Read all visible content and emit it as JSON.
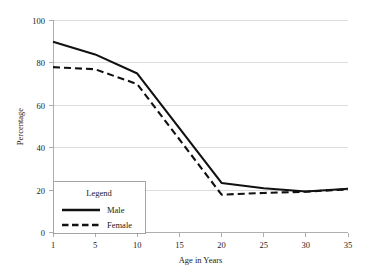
{
  "chart_data": {
    "type": "line",
    "title": "",
    "subtitle": "",
    "xlabel": "Age in Years",
    "ylabel": "Percentage",
    "x": [
      1,
      5,
      10,
      20,
      25,
      30,
      35
    ],
    "xticks": [
      "1",
      "5",
      "10",
      "15",
      "20",
      "25",
      "30",
      "35"
    ],
    "xtick_values": [
      1,
      5,
      10,
      15,
      20,
      25,
      30,
      35
    ],
    "yticks": [
      "0",
      "20",
      "40",
      "60",
      "80",
      "100"
    ],
    "ytick_values": [
      0,
      20,
      40,
      60,
      80,
      100
    ],
    "xlim": [
      1,
      35
    ],
    "ylim": [
      0,
      100
    ],
    "grid": "horizontal",
    "legend_position": "lower-left-inside",
    "legend_title": "Legend",
    "series": [
      {
        "name": "Male",
        "style": "solid",
        "color": "#111111",
        "values": [
          90,
          84,
          75,
          23.5,
          21,
          19.5,
          20.8
        ]
      },
      {
        "name": "Female",
        "style": "dashed",
        "color": "#111111",
        "values": [
          78,
          77,
          70,
          18,
          18.8,
          19.4,
          20.5
        ]
      }
    ]
  },
  "axes": {
    "y_axis_title": "Percentage",
    "x_axis_title": "Age in Years",
    "y_tick_labels": [
      "100",
      "80",
      "60",
      "40",
      "20",
      "0"
    ],
    "x_tick_labels": [
      "1",
      "5",
      "10",
      "15",
      "20",
      "25",
      "30",
      "35"
    ]
  },
  "legend": {
    "title": "Legend",
    "entries": [
      {
        "label": "Male",
        "style": "solid"
      },
      {
        "label": "Female",
        "style": "dashed"
      }
    ]
  },
  "colors": {
    "series_line": "#111111",
    "gridline": "#cfcfcf",
    "axis": "#9a9a9a",
    "background": "#ffffff",
    "text": "#1a1a1a"
  }
}
